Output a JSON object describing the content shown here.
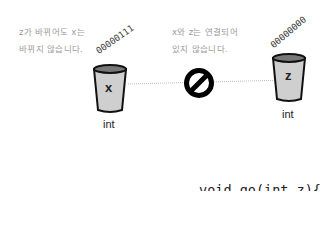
{
  "notes": {
    "left": [
      "z가 바뀌어도 x는",
      "바뀌지 않습니다."
    ],
    "right": [
      "x와 z는 연결되어",
      "있지 않습니다."
    ]
  },
  "variables": [
    {
      "name": "x",
      "type": "int",
      "bits": "00000111"
    },
    {
      "name": "z",
      "type": "int",
      "bits": "00000000"
    }
  ],
  "connector": {
    "icon": "no-sign-icon"
  },
  "code": [
    "void go(int z){",
    "   z = 0;",
    "}"
  ]
}
